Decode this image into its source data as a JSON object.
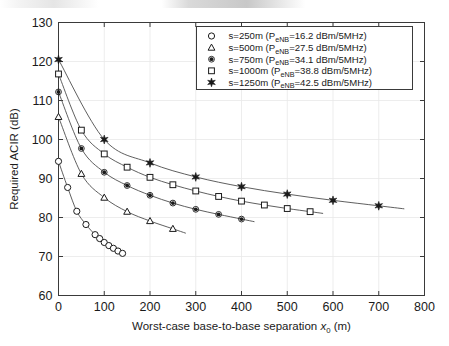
{
  "chart_data": {
    "type": "line",
    "title": "",
    "subtitle": "",
    "xlabel": "Worst-case base-to-base separation x0 (m)",
    "xlabel_main": "Worst-case base-to-base separation ",
    "xlabel_var": "x",
    "xlabel_sub": "0",
    "xlabel_unit": " (m)",
    "ylabel": "Required ACIR (dB)",
    "xlim": [
      0,
      800
    ],
    "ylim": [
      60,
      130
    ],
    "xticks": [
      0,
      100,
      200,
      300,
      400,
      500,
      600,
      700,
      800
    ],
    "yticks": [
      60,
      70,
      80,
      90,
      100,
      110,
      120,
      130
    ],
    "xtick_labels": [
      "0",
      "100",
      "200",
      "300",
      "400",
      "500",
      "600",
      "700",
      "800"
    ],
    "ytick_labels": [
      "60",
      "70",
      "80",
      "90",
      "100",
      "110",
      "120",
      "130"
    ],
    "grid": true,
    "grid_color": "#e8e8e8",
    "legend_position": "top-right",
    "line_color": "#4d4d4d",
    "marker_color": "#1a1a1a",
    "series": [
      {
        "name": "s=250m (PeNB=16.2 dBm/5MHz)",
        "label_prefix": "s=250m (P",
        "label_sub": "eNB",
        "label_suffix": "=16.2 dBm/5MHz)",
        "marker": "circle-open",
        "s_value": 250,
        "p_enb": 16.2,
        "x": [
          0,
          20,
          40,
          60,
          80,
          90,
          100,
          110,
          120,
          130,
          140
        ],
        "y": [
          94.4,
          87.7,
          81.6,
          78.2,
          75.6,
          74.6,
          73.6,
          72.8,
          72.1,
          71.4,
          70.8
        ]
      },
      {
        "name": "s=500m (PeNB=27.5 dBm/5MHz)",
        "label_prefix": "s=500m (P",
        "label_sub": "eNB",
        "label_suffix": "=27.5 dBm/5MHz)",
        "marker": "triangle-open",
        "s_value": 500,
        "p_enb": 27.5,
        "x": [
          0,
          50,
          100,
          150,
          200,
          250
        ],
        "y": [
          105.8,
          91.2,
          85.1,
          81.5,
          79.1,
          77.1
        ]
      },
      {
        "name": "s=750m (PeNB=34.1 dBm/5MHz)",
        "label_prefix": "s=750m (P",
        "label_sub": "eNB",
        "label_suffix": "=34.1 dBm/5MHz)",
        "marker": "dot-filled",
        "s_value": 750,
        "p_enb": 34.1,
        "x": [
          0,
          50,
          100,
          150,
          200,
          250,
          300,
          350,
          400
        ],
        "y": [
          112.2,
          97.7,
          91.6,
          88.2,
          85.7,
          83.7,
          82.1,
          80.8,
          79.6
        ]
      },
      {
        "name": "s=1000m (PeNB=38.8 dBm/5MHz)",
        "label_prefix": "s=1000m (P",
        "label_sub": "eNB",
        "label_suffix": "=38.8 dBm/5MHz)",
        "marker": "square-open",
        "s_value": 1000,
        "p_enb": 38.8,
        "x": [
          0,
          50,
          100,
          150,
          200,
          250,
          300,
          350,
          400,
          450,
          500,
          550
        ],
        "y": [
          116.8,
          102.4,
          96.3,
          92.9,
          90.3,
          88.4,
          86.8,
          85.4,
          84.2,
          83.2,
          82.3,
          81.5
        ]
      },
      {
        "name": "s=1250m (PeNB=42.5 dBm/5MHz)",
        "label_prefix": "s=1250m (P",
        "label_sub": "eNB",
        "label_suffix": "=42.5 dBm/5MHz)",
        "marker": "star-filled",
        "s_value": 1250,
        "p_enb": 42.5,
        "x": [
          0,
          100,
          200,
          300,
          400,
          500,
          600,
          700
        ],
        "y": [
          120.5,
          100.0,
          94.0,
          90.4,
          87.9,
          86.0,
          84.4,
          83.0
        ]
      }
    ]
  }
}
